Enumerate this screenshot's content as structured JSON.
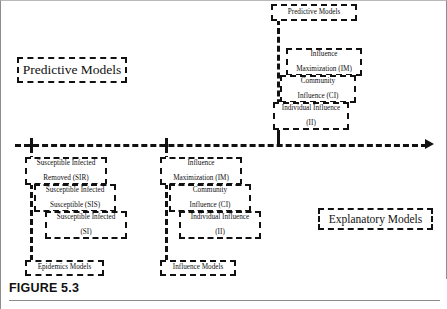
{
  "figure": {
    "caption": "FIGURE 5.3",
    "axis_arrow_icon": "arrow-right-icon"
  },
  "axis": {
    "left_pole_label": "Predictive Models",
    "right_pole_label": "Explanatory Models",
    "ticks": [
      "Epidemics Models",
      "Influence Models",
      "Influence Models (predictive)"
    ]
  },
  "upper_cluster": {
    "title": "Predictive Models",
    "boxes": [
      {
        "line1": "Influence",
        "line2": "Maximization (IM)"
      },
      {
        "line1": "Community",
        "line2": "Influence (CI)"
      },
      {
        "line1": "Individual Influence",
        "line2": "(II)"
      }
    ]
  },
  "epidemics_cluster": {
    "axis_label": "Epidemics Models",
    "boxes": [
      {
        "line1": "Susceptible Infected",
        "line2": "Removed (SIR)"
      },
      {
        "line1": "Susceptible Infected",
        "line2": "Susceptible (SIS)"
      },
      {
        "line1": "Susceptible Infected",
        "line2": "(SI)"
      }
    ]
  },
  "influence_cluster": {
    "axis_label": "Influence Models",
    "boxes": [
      {
        "line1": "Influence",
        "line2": "Maximization (IM)"
      },
      {
        "line1": "Community",
        "line2": "Influence (CI)"
      },
      {
        "line1": "Individual Influence",
        "line2": "(II)"
      }
    ]
  }
}
